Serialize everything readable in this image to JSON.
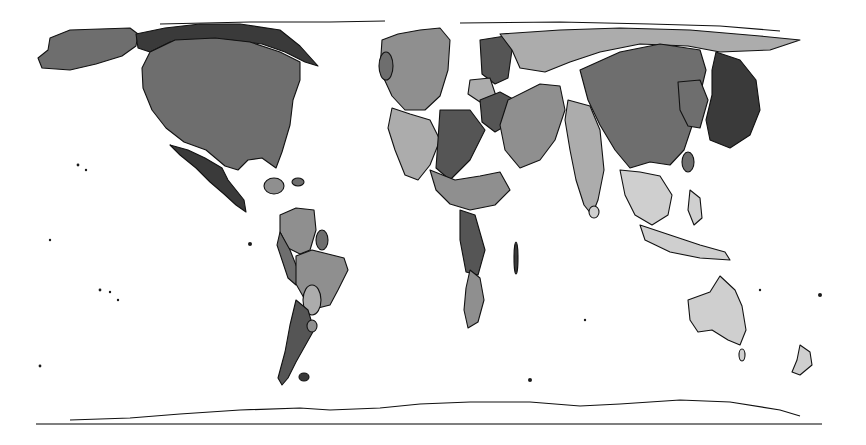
{
  "map": {
    "type": "cartogram",
    "projection": "equirectangular-distorted",
    "palette": {
      "background": "#ffffff",
      "outline": "#111111",
      "shade_darkest": "#3a3a3a",
      "shade_dark": "#555555",
      "shade_mid": "#6e6e6e",
      "shade_light": "#8f8f8f",
      "shade_lighter": "#acacac",
      "shade_lightest": "#cfcfcf"
    },
    "regions": [
      {
        "name": "alaska",
        "shade": "shade_mid"
      },
      {
        "name": "canada",
        "shade": "shade_darkest"
      },
      {
        "name": "united-states",
        "shade": "shade_mid"
      },
      {
        "name": "mexico",
        "shade": "shade_darkest"
      },
      {
        "name": "cuba",
        "shade": "shade_light"
      },
      {
        "name": "venezuela-colombia",
        "shade": "shade_light"
      },
      {
        "name": "brazil",
        "shade": "shade_light"
      },
      {
        "name": "argentina-chile",
        "shade": "shade_dark"
      },
      {
        "name": "europe-west",
        "shade": "shade_light"
      },
      {
        "name": "europe-east",
        "shade": "shade_dark"
      },
      {
        "name": "russia",
        "shade": "shade_lighter"
      },
      {
        "name": "africa-north",
        "shade": "shade_lighter"
      },
      {
        "name": "africa-south",
        "shade": "shade_light"
      },
      {
        "name": "middle-east",
        "shade": "shade_light"
      },
      {
        "name": "india",
        "shade": "shade_lighter"
      },
      {
        "name": "china",
        "shade": "shade_mid"
      },
      {
        "name": "korea",
        "shade": "shade_mid"
      },
      {
        "name": "japan",
        "shade": "shade_darkest"
      },
      {
        "name": "southeast-asia",
        "shade": "shade_lightest"
      },
      {
        "name": "australia",
        "shade": "shade_lightest"
      },
      {
        "name": "new-zealand",
        "shade": "shade_lightest"
      },
      {
        "name": "antarctica",
        "shade": "background"
      }
    ]
  }
}
